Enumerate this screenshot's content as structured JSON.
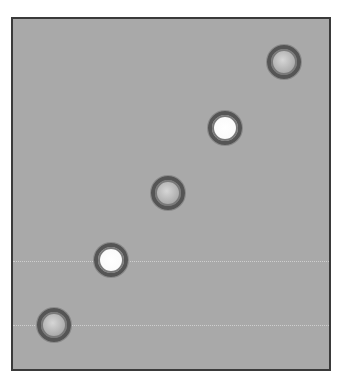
{
  "panel": {
    "background": "#a9a9a9",
    "border": "#3a3a3a"
  },
  "gridlines": [
    {
      "y": 242
    },
    {
      "y": 306
    }
  ],
  "circles": [
    {
      "id": 1,
      "style": "gray",
      "cx": 271,
      "cy": 43,
      "r": 17
    },
    {
      "id": 2,
      "style": "white",
      "cx": 212,
      "cy": 109,
      "r": 17
    },
    {
      "id": 3,
      "style": "gray",
      "cx": 155,
      "cy": 174,
      "r": 17
    },
    {
      "id": 4,
      "style": "white",
      "cx": 98,
      "cy": 241,
      "r": 17
    },
    {
      "id": 5,
      "style": "gray",
      "cx": 41,
      "cy": 306,
      "r": 17
    }
  ]
}
